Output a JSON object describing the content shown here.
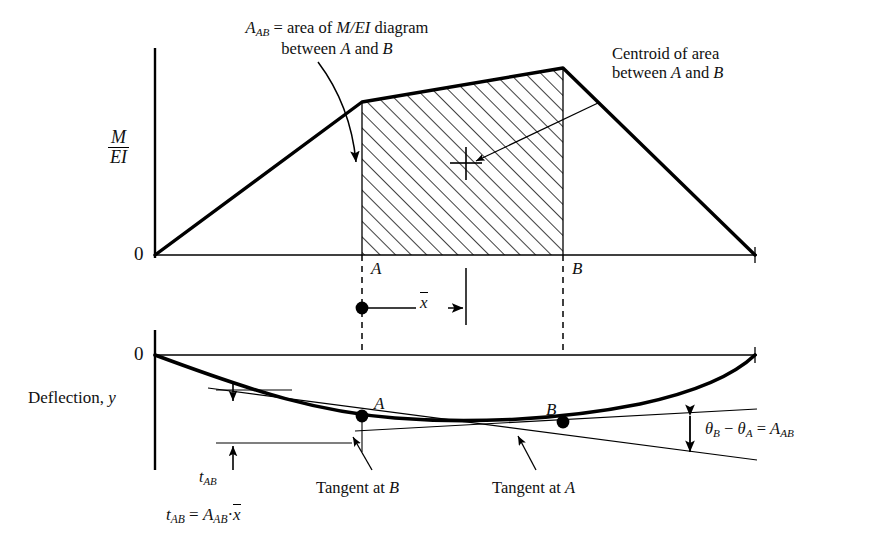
{
  "figure": {
    "title_note_area": "A_AB = area of M/EI diagram between A and B",
    "annotations": {
      "area_note_line1_pre": "A",
      "area_note_line1_sub": "AB",
      "area_note_line1_post": " = area of ",
      "area_note_line1_mei": "M/EI",
      "area_note_line1_tail": " diagram",
      "area_note_line2": "between A and B",
      "centroid_line1": "Centroid of area",
      "centroid_line2": "between A and B",
      "tangent_at_b": "Tangent at B",
      "tangent_at_a": "Tangent at A",
      "deflection_label_pre": "Deflection, ",
      "deflection_label_var": "y"
    },
    "axes": {
      "mei_numerator": "M",
      "mei_denominator": "EI",
      "zero_top": "0",
      "zero_bottom": "0"
    },
    "markers": {
      "point_a_top": "A",
      "point_b_top": "B",
      "point_a_bottom": "A",
      "point_b_bottom": "B",
      "xbar": "x",
      "t_ab": "t",
      "t_ab_sub": "AB"
    },
    "equations": {
      "theta_lhs_theta_b": "θ",
      "theta_sub_b": "B",
      "theta_minus": " − ",
      "theta_lhs_theta_a": "θ",
      "theta_sub_a": "A",
      "theta_eq": " = ",
      "theta_rhs": "A",
      "theta_rhs_sub": "AB",
      "bottom_t": "t",
      "bottom_t_sub": "AB",
      "bottom_eq": " = ",
      "bottom_a": "A",
      "bottom_a_sub": "AB",
      "bottom_dot": "·",
      "bottom_xbar": "x"
    },
    "colors": {
      "ink": "#000000",
      "background": "#ffffff",
      "thin_line": "#333333"
    },
    "chart_geometry": {
      "mei_origin": [
        155,
        255
      ],
      "mei_point_a_x": 362,
      "mei_point_b_x": 563,
      "mei_knee_left": [
        362,
        102
      ],
      "mei_peak": [
        563,
        68
      ],
      "mei_right_end": [
        755,
        255
      ],
      "deflection_zero_y": 355,
      "deflection_min_y": 413
    }
  }
}
